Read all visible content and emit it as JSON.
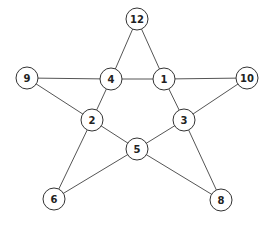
{
  "graph": {
    "type": "undirected",
    "nodes": [
      {
        "id": "12",
        "label": "12"
      },
      {
        "id": "9",
        "label": "9"
      },
      {
        "id": "4",
        "label": "4"
      },
      {
        "id": "1",
        "label": "1"
      },
      {
        "id": "10",
        "label": "10"
      },
      {
        "id": "2",
        "label": "2"
      },
      {
        "id": "3",
        "label": "3"
      },
      {
        "id": "5",
        "label": "5"
      },
      {
        "id": "6",
        "label": "6"
      },
      {
        "id": "8",
        "label": "8"
      }
    ],
    "edges": [
      [
        "12",
        "4"
      ],
      [
        "12",
        "1"
      ],
      [
        "9",
        "4"
      ],
      [
        "4",
        "1"
      ],
      [
        "1",
        "10"
      ],
      [
        "9",
        "2"
      ],
      [
        "4",
        "2"
      ],
      [
        "1",
        "3"
      ],
      [
        "10",
        "3"
      ],
      [
        "2",
        "5"
      ],
      [
        "3",
        "5"
      ],
      [
        "2",
        "6"
      ],
      [
        "5",
        "6"
      ],
      [
        "3",
        "8"
      ],
      [
        "5",
        "8"
      ]
    ]
  }
}
